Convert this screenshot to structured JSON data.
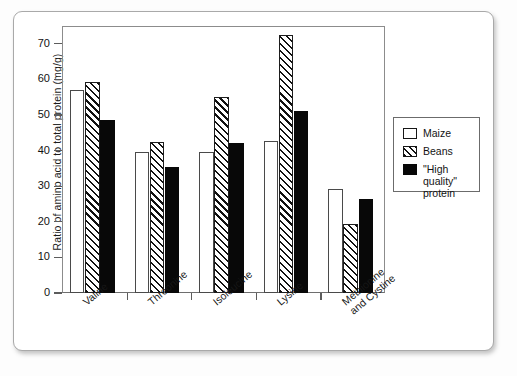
{
  "chart_data": {
    "type": "bar",
    "title": "",
    "xlabel": "",
    "ylabel": "Ratio of amino acid to total protein (mg/g)",
    "ylim": [
      0,
      75
    ],
    "yticks": [
      0,
      10,
      20,
      30,
      40,
      50,
      60,
      70
    ],
    "grid": false,
    "legend_position": "right",
    "categories": [
      "Valine",
      "Threonine",
      "Isoleucine",
      "Lysine",
      "Methionine\nand Cystine"
    ],
    "series": [
      {
        "name": "Maize",
        "pattern": "open",
        "values": [
          57.0,
          39.5,
          39.5,
          42.7,
          29.3
        ]
      },
      {
        "name": "Beans",
        "pattern": "hatched",
        "values": [
          59.3,
          42.3,
          55.2,
          72.5,
          19.5
        ]
      },
      {
        "name": "\"High quality\" protein",
        "pattern": "solid-black",
        "values": [
          48.7,
          35.3,
          42.0,
          51.2,
          26.5
        ]
      }
    ]
  },
  "legend": {
    "entries": [
      {
        "label": "Maize"
      },
      {
        "label": "Beans"
      },
      {
        "label": "\"High quality\"\nprotein"
      }
    ]
  },
  "colors": {
    "maize": "#ffffff",
    "beans_hatch": "#111111",
    "high_quality": "#080808",
    "axis": "#5c5c5c",
    "frame": "#8c8c8c",
    "card_border": "#a9a9a9"
  }
}
